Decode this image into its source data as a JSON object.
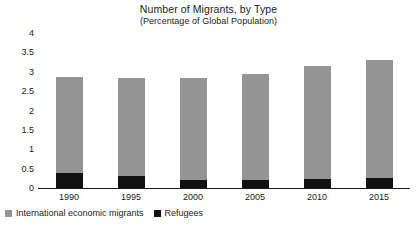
{
  "chart_data": {
    "type": "bar",
    "stacked": true,
    "title": "Number of Migrants, by Type",
    "subtitle": "(Percentage of Global Population)",
    "xlabel": "",
    "ylabel": "",
    "ylim": [
      0,
      4
    ],
    "ytick_step": 0.5,
    "grid": false,
    "legend_position": "bottom-left",
    "categories": [
      "1990",
      "1995",
      "2000",
      "2005",
      "2010",
      "2015"
    ],
    "ytick_labels": [
      "4",
      "3.5",
      "3",
      "2.5",
      "2",
      "1.5",
      "1",
      "0.5",
      "0"
    ],
    "ytick_values": [
      4,
      3.5,
      3,
      2.5,
      2,
      1.5,
      1,
      0.5,
      0
    ],
    "series": [
      {
        "name": "Refugees",
        "color": "#111111",
        "values": [
          0.4,
          0.3,
          0.2,
          0.2,
          0.23,
          0.25
        ]
      },
      {
        "name": "International economic migrants",
        "color": "#949494",
        "values": [
          2.47,
          2.55,
          2.65,
          2.75,
          2.92,
          3.05
        ]
      }
    ],
    "totals": [
      2.87,
      2.85,
      2.85,
      2.95,
      3.15,
      3.3
    ]
  },
  "legend": {
    "items": [
      {
        "label": "International economic migrants",
        "swatch": "gray-square-swatch"
      },
      {
        "label": "Refugees",
        "swatch": "black-square-swatch"
      }
    ]
  },
  "colors": {
    "economic_migrants": "#949494",
    "refugees": "#111111",
    "axis": "#1a1a1a",
    "background": "#ffffff"
  }
}
